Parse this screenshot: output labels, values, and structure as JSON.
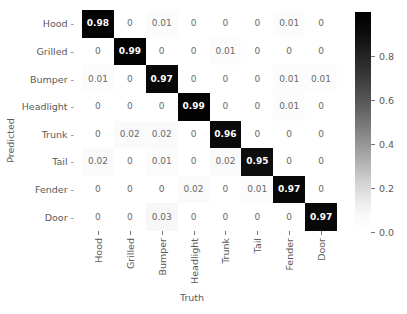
{
  "chart_data": {
    "type": "heatmap",
    "title": "",
    "xlabel": "Truth",
    "ylabel": "Predicted",
    "categories_x": [
      "Hood",
      "Grilled",
      "Bumper",
      "Headlight",
      "Trunk",
      "Tail",
      "Fender",
      "Door"
    ],
    "categories_y": [
      "Hood",
      "Grilled",
      "Bumper",
      "Headlight",
      "Trunk",
      "Tail",
      "Fender",
      "Door"
    ],
    "colormap": "greys_reversed",
    "colorbar": {
      "ticks": [
        "0.8",
        "0.6",
        "0.4",
        "0.2",
        "0.0"
      ],
      "tick_values": [
        0.8,
        0.6,
        0.4,
        0.2,
        0.0
      ],
      "vmin": 0.0,
      "vmax": 1.0,
      "position": "right"
    },
    "grid": false,
    "annotated": true,
    "rows": [
      {
        "label": "Hood",
        "values": [
          0.98,
          0,
          0.01,
          0,
          0,
          0,
          0.01,
          0
        ],
        "display": [
          "0.98",
          "0",
          "0.01",
          "0",
          "0",
          "0",
          "0.01",
          "0"
        ]
      },
      {
        "label": "Grilled",
        "values": [
          0,
          0.99,
          0,
          0,
          0.01,
          0,
          0,
          0
        ],
        "display": [
          "0",
          "0.99",
          "0",
          "0",
          "0.01",
          "0",
          "0",
          "0"
        ]
      },
      {
        "label": "Bumper",
        "values": [
          0.01,
          0,
          0.97,
          0,
          0,
          0,
          0.01,
          0.01
        ],
        "display": [
          "0.01",
          "0",
          "0.97",
          "0",
          "0",
          "0",
          "0.01",
          "0.01"
        ]
      },
      {
        "label": "Headlight",
        "values": [
          0,
          0,
          0,
          0.99,
          0,
          0,
          0.01,
          0
        ],
        "display": [
          "0",
          "0",
          "0",
          "0.99",
          "0",
          "0",
          "0.01",
          "0"
        ]
      },
      {
        "label": "Trunk",
        "values": [
          0,
          0.02,
          0.02,
          0,
          0.96,
          0,
          0,
          0
        ],
        "display": [
          "0",
          "0.02",
          "0.02",
          "0",
          "0.96",
          "0",
          "0",
          "0"
        ]
      },
      {
        "label": "Tail",
        "values": [
          0.02,
          0,
          0.01,
          0,
          0.02,
          0.95,
          0,
          0
        ],
        "display": [
          "0.02",
          "0",
          "0.01",
          "0",
          "0.02",
          "0.95",
          "0",
          "0"
        ]
      },
      {
        "label": "Fender",
        "values": [
          0,
          0,
          0,
          0.02,
          0,
          0.01,
          0.97,
          0
        ],
        "display": [
          "0",
          "0",
          "0",
          "0.02",
          "0",
          "0.01",
          "0.97",
          "0"
        ]
      },
      {
        "label": "Door",
        "values": [
          0,
          0,
          0.03,
          0,
          0,
          0,
          0,
          0.97
        ],
        "display": [
          "0",
          "0",
          "0.03",
          "0",
          "0",
          "0",
          "0",
          "0.97"
        ]
      }
    ]
  },
  "axes": {
    "tick_dash": "-"
  }
}
